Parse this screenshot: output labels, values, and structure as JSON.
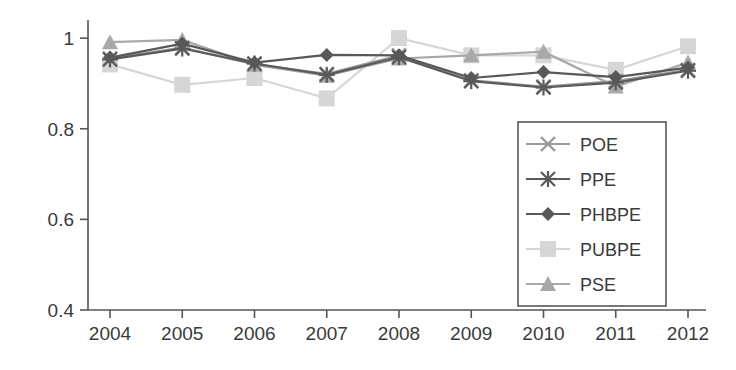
{
  "chart_data": {
    "type": "line",
    "title": "",
    "xlabel": "",
    "ylabel": "",
    "categories": [
      "2004",
      "2005",
      "2006",
      "2007",
      "2008",
      "2009",
      "2010",
      "2011",
      "2012"
    ],
    "x": [
      2004,
      2005,
      2006,
      2007,
      2008,
      2009,
      2010,
      2011,
      2012
    ],
    "ylim": [
      0.4,
      1.04
    ],
    "yticks": [
      0.4,
      0.6,
      0.8,
      1.0
    ],
    "ytick_labels": [
      "0.4",
      "0.6",
      "0.8",
      "1"
    ],
    "grid": false,
    "legend_position": "inside-bottom-right",
    "series": [
      {
        "name": "POE",
        "marker": "x",
        "color": "#9a9a9a",
        "values": [
          0.955,
          0.979,
          0.942,
          0.921,
          0.962,
          0.907,
          0.893,
          0.905,
          0.93
        ]
      },
      {
        "name": "PPE",
        "marker": "asterisk",
        "color": "#5a5a5a",
        "values": [
          0.953,
          0.977,
          0.944,
          0.919,
          0.958,
          0.905,
          0.891,
          0.902,
          0.928
        ]
      },
      {
        "name": "PHBPE",
        "marker": "diamond",
        "color": "#585858",
        "values": [
          0.957,
          0.988,
          0.946,
          0.963,
          0.962,
          0.912,
          0.925,
          0.914,
          0.935
        ]
      },
      {
        "name": "PUBPE",
        "marker": "square",
        "color": "#d6d6d6",
        "values": [
          0.942,
          0.897,
          0.912,
          0.867,
          1.0,
          0.962,
          0.962,
          0.93,
          0.982
        ]
      },
      {
        "name": "PSE",
        "marker": "triangle",
        "color": "#a8a8a8",
        "values": [
          0.991,
          0.996,
          0.941,
          0.917,
          0.955,
          0.962,
          0.97,
          0.893,
          0.946
        ]
      }
    ]
  },
  "legend": {
    "entries": [
      {
        "label": "POE"
      },
      {
        "label": "PPE"
      },
      {
        "label": "PHBPE"
      },
      {
        "label": "PUBPE"
      },
      {
        "label": "PSE"
      }
    ]
  },
  "axes": {
    "y_tick_labels": [
      "1",
      "0.8",
      "0.6",
      "0.4"
    ],
    "x_tick_labels": [
      "2004",
      "2005",
      "2006",
      "2007",
      "2008",
      "2009",
      "2010",
      "2011",
      "2012"
    ]
  }
}
